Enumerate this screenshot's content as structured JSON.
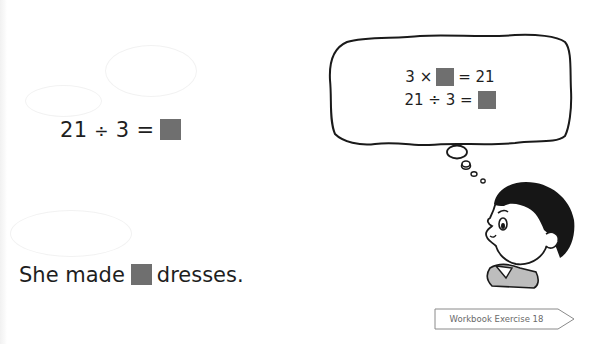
{
  "main": {
    "equation": {
      "dividend": "21",
      "operator": "÷",
      "divisor": "3",
      "equals": "=",
      "answer_box": "blank"
    },
    "sentence": {
      "prefix": "She made",
      "suffix": "dresses.",
      "answer_box": "blank"
    }
  },
  "thought_bubble": {
    "line1": {
      "left": "3 ×",
      "right": "= 21"
    },
    "line2": {
      "left": "21 ÷ 3 ="
    }
  },
  "character": {
    "icon": "thinking-boy-illustration"
  },
  "footer": {
    "workbook_label": "Workbook Exercise 18",
    "icon": "arrow-tag-icon"
  },
  "colors": {
    "answer_box": "#6f6f6f",
    "text": "#1e1e1e",
    "tag_border": "#8a8a8a",
    "tag_text": "#6a6a6a"
  }
}
